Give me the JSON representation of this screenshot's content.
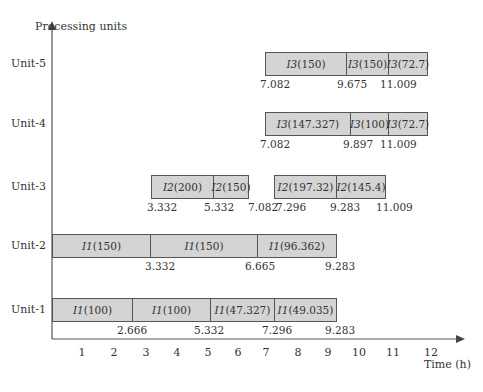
{
  "chart_data": {
    "type": "gantt",
    "title": "",
    "ylabel": "Processing units",
    "xlabel": "Time (h)",
    "x_ticks": [
      1,
      2,
      3,
      4,
      5,
      6,
      7,
      8,
      9,
      10,
      11,
      12
    ],
    "xlim": [
      0,
      12.8
    ],
    "units": [
      "Unit-5",
      "Unit-4",
      "Unit-3",
      "Unit-2",
      "Unit-1"
    ],
    "tasks": [
      {
        "unit": "Unit-5",
        "label": "I3 (150)",
        "start": 7.082,
        "end": 9.675
      },
      {
        "unit": "Unit-5",
        "label": "I3 (150)",
        "start": 9.675,
        "end": 11.009
      },
      {
        "unit": "Unit-5",
        "label": "I3 (72.7)",
        "start": 11.009,
        "end": 12.3
      },
      {
        "unit": "Unit-4",
        "label": "I3 (147.327)",
        "start": 7.082,
        "end": 9.897
      },
      {
        "unit": "Unit-4",
        "label": "I3 (100)",
        "start": 9.897,
        "end": 11.009
      },
      {
        "unit": "Unit-4",
        "label": "I3 (72.7)",
        "start": 11.009,
        "end": 12.3
      },
      {
        "unit": "Unit-3",
        "label": "I2 (200)",
        "start": 3.332,
        "end": 5.332
      },
      {
        "unit": "Unit-3",
        "label": "I2 (150)",
        "start": 5.332,
        "end": 7.082
      },
      {
        "unit": "Unit-3",
        "label": "I2 (197.32)",
        "start": 7.296,
        "end": 9.283
      },
      {
        "unit": "Unit-3",
        "label": "I2 (145.4)",
        "start": 9.283,
        "end": 11.009
      },
      {
        "unit": "Unit-2",
        "label": "I1 (150)",
        "start": 0,
        "end": 3.332
      },
      {
        "unit": "Unit-2",
        "label": "I1 (150)",
        "start": 3.332,
        "end": 6.665
      },
      {
        "unit": "Unit-2",
        "label": "I1 (96.362)",
        "start": 6.665,
        "end": 9.283
      },
      {
        "unit": "Unit-1",
        "label": "I1 (100)",
        "start": 0,
        "end": 2.666
      },
      {
        "unit": "Unit-1",
        "label": "I1 (100)",
        "start": 2.666,
        "end": 5.332
      },
      {
        "unit": "Unit-1",
        "label": "I1 (47.327)",
        "start": 5.332,
        "end": 7.296
      },
      {
        "unit": "Unit-1",
        "label": "I1 (49.035)",
        "start": 7.296,
        "end": 9.283
      }
    ],
    "time_annotations": {
      "Unit-5": [
        "7.082",
        "9.675",
        "11.009"
      ],
      "Unit-4": [
        "7.082",
        "9.897",
        "11.009"
      ],
      "Unit-3": [
        "3.332",
        "5.332",
        "7.082",
        "7.296",
        "9.283",
        "11.009"
      ],
      "Unit-2": [
        "3.332",
        "6.665",
        "9.283"
      ],
      "Unit-1": [
        "2.666",
        "5.332",
        "7.296",
        "9.283"
      ]
    }
  },
  "axis": {
    "y_title": "Processing units",
    "x_title": "Time (h)"
  },
  "units": [
    {
      "name": "Unit-5",
      "top": 52,
      "bars": [
        {
          "l": 265,
          "r": 346,
          "prefix": "I3",
          "qty": " (150)"
        },
        {
          "l": 346,
          "r": 388,
          "prefix": "I3",
          "qty": " (150)"
        },
        {
          "l": 388,
          "r": 427,
          "prefix": "I3",
          "qty": " (72.7)"
        }
      ],
      "nums": [
        {
          "x": 260,
          "t": "7.082"
        },
        {
          "x": 337,
          "t": "9.675"
        },
        {
          "x": 380,
          "t": "11.009"
        }
      ]
    },
    {
      "name": "Unit-4",
      "top": 112,
      "bars": [
        {
          "l": 265,
          "r": 350,
          "prefix": "I3",
          "qty": " (147.327)"
        },
        {
          "l": 350,
          "r": 388,
          "prefix": "I3",
          "qty": " (100)"
        },
        {
          "l": 388,
          "r": 427,
          "prefix": "I3",
          "qty": " (72.7)"
        }
      ],
      "nums": [
        {
          "x": 260,
          "t": "7.082"
        },
        {
          "x": 343,
          "t": "9.897"
        },
        {
          "x": 380,
          "t": "11.009"
        }
      ]
    },
    {
      "name": "Unit-3",
      "top": 175,
      "bars": [
        {
          "l": 151,
          "r": 213,
          "prefix": "I2",
          "qty": " (200)"
        },
        {
          "l": 213,
          "r": 248,
          "prefix": "I2",
          "qty": " (150)"
        },
        {
          "l": 274,
          "r": 336,
          "prefix": "I2",
          "qty": " (197.32)"
        },
        {
          "l": 336,
          "r": 385,
          "prefix": "I2",
          "qty": " (145.4)"
        }
      ],
      "nums": [
        {
          "x": 147,
          "t": "3.332"
        },
        {
          "x": 204,
          "t": "5.332"
        },
        {
          "x": 248,
          "t": "7.082"
        },
        {
          "x": 276,
          "t": "7.296"
        },
        {
          "x": 330,
          "t": "9.283"
        },
        {
          "x": 376,
          "t": "11.009"
        }
      ]
    },
    {
      "name": "Unit-2",
      "top": 234,
      "bars": [
        {
          "l": 52,
          "r": 150,
          "prefix": "I1",
          "qty": " (150)"
        },
        {
          "l": 150,
          "r": 257,
          "prefix": "I1",
          "qty": " (150)"
        },
        {
          "l": 257,
          "r": 336,
          "prefix": "I1",
          "qty": " (96.362)"
        }
      ],
      "nums": [
        {
          "x": 145,
          "t": "3.332"
        },
        {
          "x": 245,
          "t": "6.665"
        },
        {
          "x": 325,
          "t": "9.283"
        }
      ]
    },
    {
      "name": "Unit-1",
      "top": 298,
      "bars": [
        {
          "l": 52,
          "r": 132,
          "prefix": "I1",
          "qty": " (100)"
        },
        {
          "l": 132,
          "r": 210,
          "prefix": "I1",
          "qty": " (100)"
        },
        {
          "l": 210,
          "r": 274,
          "prefix": "I1",
          "qty": " (47.327)"
        },
        {
          "l": 274,
          "r": 336,
          "prefix": "I1",
          "qty": " (49.035)"
        }
      ],
      "nums": [
        {
          "x": 117,
          "t": "2.666"
        },
        {
          "x": 194,
          "t": "5.332"
        },
        {
          "x": 262,
          "t": "7.296"
        },
        {
          "x": 325,
          "t": "9.283"
        }
      ]
    }
  ],
  "ticks": [
    {
      "x": 82,
      "t": "1"
    },
    {
      "x": 114,
      "t": "2"
    },
    {
      "x": 146,
      "t": "3"
    },
    {
      "x": 177,
      "t": "4"
    },
    {
      "x": 208,
      "t": "5"
    },
    {
      "x": 238,
      "t": "6"
    },
    {
      "x": 266,
      "t": "7"
    },
    {
      "x": 298,
      "t": "8"
    },
    {
      "x": 328,
      "t": "9"
    },
    {
      "x": 359,
      "t": "10"
    },
    {
      "x": 393,
      "t": "11"
    },
    {
      "x": 431,
      "t": "12"
    }
  ],
  "colors": {
    "bar_fill": "#d4d4d4",
    "bar_border": "#555555",
    "axis": "#555555",
    "text": "#333333"
  }
}
